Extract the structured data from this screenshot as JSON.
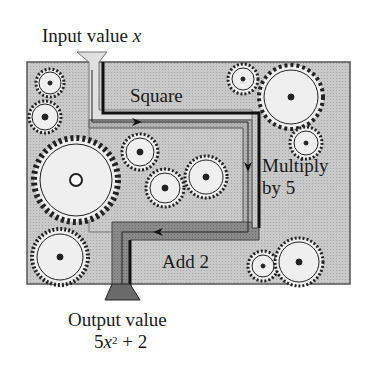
{
  "diagram": {
    "input_label": "Input value",
    "input_var": "x",
    "steps": [
      {
        "label": "Square"
      },
      {
        "label": "Multiply",
        "label2": "by 5"
      },
      {
        "label": "Add 2"
      }
    ],
    "output_label": "Output value",
    "output_expr": {
      "coef": "5",
      "var": "x",
      "exp": "2",
      "rest": " + 2"
    },
    "colors": {
      "box": "#c8c8c8",
      "box_border": "#555555",
      "path_light": "#e2e2e2",
      "path_mid": "#a9a9a9",
      "path_dark": "#6a6a6a",
      "gear_fill": "#efefef",
      "gear_stroke": "#222222"
    }
  }
}
